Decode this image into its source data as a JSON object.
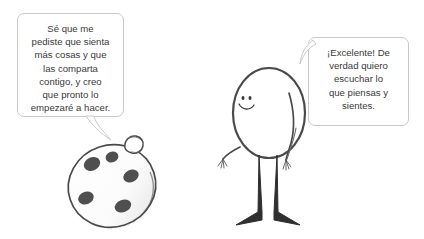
{
  "scene": {
    "background_color": "#ffffff",
    "style": "hand-drawn pencil cartoon",
    "ink_color": "#4a4a4a",
    "bubble_border_color": "#c9c9c9",
    "bubble_fill_color": "#ffffff",
    "text_color": "#3a3a3a"
  },
  "characters": [
    {
      "id": "egg-character",
      "name": "spotted egg character",
      "description": "oval egg-shaped body with five dark spots and a small knob on top",
      "spot_count": 5,
      "spot_color": "#4f4f4f"
    },
    {
      "id": "stick-character",
      "name": "stick figure character",
      "description": "oval head-body with smiling face, two thin arms with fingers, two thick legs with triangular feet",
      "expression": "smiling",
      "eye_count": 2
    }
  ],
  "speech_bubbles": [
    {
      "id": "bubble-left",
      "speaker": "egg-character",
      "text": "Sé que me\npediste que sienta\nmás cosas y que\nlas comparta\ncontigo, y creo\nque pronto lo\nempezaré a hacer.",
      "tail_direction": "down-right"
    },
    {
      "id": "bubble-right",
      "speaker": "stick-character",
      "text": "¡Excelente! De\nverdad quiero\nescuchar lo\nque piensas y\nsientes.",
      "tail_direction": "down-left"
    }
  ]
}
